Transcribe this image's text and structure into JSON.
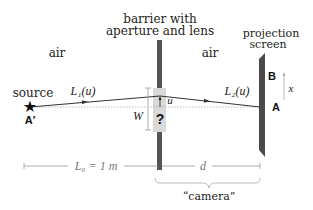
{
  "labels": {
    "barrier_line1": "barrier with",
    "barrier_line2": "aperture and lens",
    "screen_line1": "projection",
    "screen_line2": "screen",
    "air_left": "air",
    "air_right": "air",
    "source": "source",
    "point_a_prime": "A′",
    "point_a": "A",
    "point_b": "B",
    "path1": "L₁(u)",
    "path2": "L₂(u)",
    "u": "u",
    "w": "W",
    "x": "x",
    "question": "?",
    "l0": "L₀ = 1 m",
    "d": "d",
    "camera": "“camera”"
  },
  "colors": {
    "barrier": "#555555",
    "aperture": "#d9d9d9",
    "screen": "#4a4a4a",
    "ray": "#333333",
    "dimension": "#999999"
  }
}
